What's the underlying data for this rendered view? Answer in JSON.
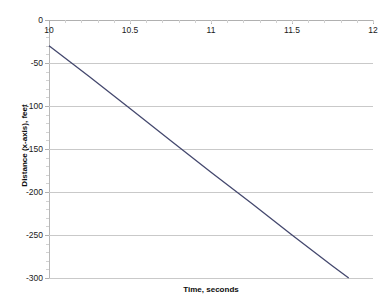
{
  "chart_data": {
    "type": "line",
    "title": "",
    "xlabel": "Time, seconds",
    "ylabel": "Distance (x-axis), feet",
    "xlim": [
      10,
      12
    ],
    "ylim": [
      -300,
      0
    ],
    "grid": true,
    "legend": false,
    "xticks": [
      10,
      10.5,
      11,
      11.5,
      12
    ],
    "xtick_labels": [
      "10",
      "10.5",
      "11",
      "11.5",
      "12"
    ],
    "yticks": [
      0,
      -50,
      -100,
      -150,
      -200,
      -250,
      -300
    ],
    "ytick_labels": [
      "0",
      "-50",
      "-100",
      "-150",
      "-200",
      "-250",
      "-300"
    ],
    "series": [
      {
        "name": "Distance",
        "color": "#44486e",
        "x": [
          10.0,
          10.25,
          10.5,
          10.75,
          11.0,
          11.25,
          11.5,
          11.75,
          11.85
        ],
        "values": [
          -30,
          -66,
          -103,
          -140,
          -177,
          -213,
          -250,
          -286,
          -300
        ]
      }
    ]
  },
  "axes": {
    "x_title": "Time, seconds",
    "y_title": "Distance (x-axis), feet"
  },
  "style": {
    "line_color": "#44486e",
    "grid_color": "#c9c9c9",
    "background": "#ffffff",
    "text_color": "#1a1a1a"
  }
}
